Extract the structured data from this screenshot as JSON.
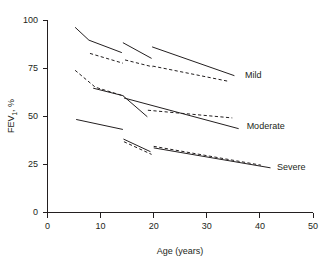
{
  "chart_data": {
    "type": "line",
    "title": "",
    "subtitle": "",
    "xlabel": "Age (years)",
    "ylabel": "FEV1, %",
    "ylabel_base": "FEV",
    "ylabel_sub": "1",
    "ylabel_suffix": ", %",
    "xlim": [
      0,
      50
    ],
    "ylim": [
      0,
      100
    ],
    "xticks": [
      0,
      10,
      20,
      30,
      40,
      50
    ],
    "yticks": [
      0,
      25,
      50,
      75,
      100
    ],
    "xtick_labels": [
      "0",
      "10",
      "20",
      "30",
      "40",
      "50"
    ],
    "ytick_labels": [
      "0",
      "25",
      "50",
      "75",
      "100"
    ],
    "grid": false,
    "legend_position": "inline-right",
    "line_color": "#231f20",
    "annotations": [
      {
        "name": "mild",
        "text": "Mild",
        "x": 37.2,
        "y": 71.5
      },
      {
        "name": "moderate",
        "text": "Moderate",
        "x": 37.5,
        "y": 45.0
      },
      {
        "name": "severe",
        "text": "Severe",
        "x": 43.2,
        "y": 23.5
      }
    ],
    "series": [
      {
        "name": "Mild cohort 1 solid",
        "group": "Mild",
        "style": "solid",
        "points": [
          [
            5.2,
            96.2
          ],
          [
            7.8,
            89.5
          ],
          [
            14.0,
            83.0
          ]
        ]
      },
      {
        "name": "Mild cohort 1 dashed",
        "group": "Mild",
        "style": "dashed",
        "points": [
          [
            8.0,
            82.6
          ],
          [
            14.2,
            77.5
          ]
        ]
      },
      {
        "name": "Mild cohort 2 solid",
        "group": "Mild",
        "style": "solid",
        "points": [
          [
            14.2,
            88.2
          ],
          [
            19.6,
            80.0
          ]
        ]
      },
      {
        "name": "Mild cohort 2 dashed",
        "group": "Mild",
        "style": "dashed",
        "points": [
          [
            14.6,
            79.2
          ],
          [
            19.8,
            75.6
          ]
        ]
      },
      {
        "name": "Mild cohort 3 solid",
        "group": "Mild",
        "style": "solid",
        "points": [
          [
            19.7,
            86.0
          ],
          [
            35.2,
            71.0
          ]
        ]
      },
      {
        "name": "Mild cohort 3 dashed",
        "group": "Mild",
        "style": "dashed",
        "points": [
          [
            19.8,
            76.0
          ],
          [
            34.2,
            68.0
          ]
        ]
      },
      {
        "name": "Moderate cohort 1 dashed",
        "group": "Moderate",
        "style": "dashed",
        "points": [
          [
            5.2,
            73.8
          ],
          [
            9.0,
            65.0
          ],
          [
            14.4,
            60.4
          ]
        ]
      },
      {
        "name": "Moderate cohort 1 solid",
        "group": "Moderate",
        "style": "solid",
        "points": [
          [
            8.6,
            64.5
          ],
          [
            14.2,
            60.6
          ],
          [
            18.8,
            49.6
          ]
        ]
      },
      {
        "name": "Moderate cohort 2 solid",
        "group": "Moderate",
        "style": "solid",
        "points": [
          [
            14.4,
            59.4
          ],
          [
            36.0,
            43.4
          ]
        ]
      },
      {
        "name": "Moderate cohort 2 dashed",
        "group": "Moderate",
        "style": "dashed",
        "points": [
          [
            18.9,
            53.0
          ],
          [
            34.8,
            49.0
          ]
        ]
      },
      {
        "name": "Severe cohort 1 solid",
        "group": "Severe",
        "style": "solid",
        "points": [
          [
            5.4,
            48.2
          ],
          [
            14.2,
            43.0
          ]
        ]
      },
      {
        "name": "Severe cohort 2 solid",
        "group": "Severe",
        "style": "solid",
        "points": [
          [
            14.3,
            38.0
          ],
          [
            19.4,
            31.4
          ]
        ]
      },
      {
        "name": "Severe cohort 2 dashed",
        "group": "Severe",
        "style": "dashed",
        "points": [
          [
            14.4,
            36.6
          ],
          [
            19.6,
            30.0
          ]
        ]
      },
      {
        "name": "Severe cohort 3 solid",
        "group": "Severe",
        "style": "solid",
        "points": [
          [
            20.0,
            33.4
          ],
          [
            42.0,
            23.0
          ]
        ]
      },
      {
        "name": "Severe cohort 3 dashed",
        "group": "Severe",
        "style": "dashed",
        "points": [
          [
            20.0,
            34.2
          ],
          [
            40.2,
            24.4
          ]
        ]
      }
    ]
  },
  "axes": {
    "x_title": "Age (years)",
    "y_title_base": "FEV",
    "y_title_sub": "1",
    "y_title_suffix": ", %"
  }
}
